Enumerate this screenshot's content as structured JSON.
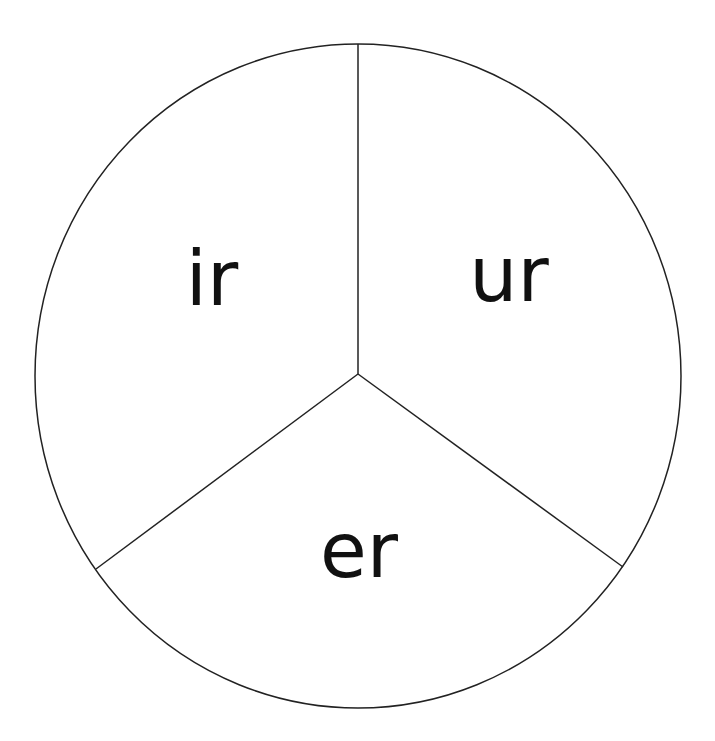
{
  "diagram": {
    "type": "spinner-circle",
    "stroke_color": "#222222",
    "background": "#ffffff",
    "circle": {
      "cx": 358,
      "cy": 376,
      "rx": 323,
      "ry": 332
    },
    "center": {
      "x": 358,
      "y": 374
    },
    "dividers": [
      {
        "x2": 358,
        "y2": 44
      },
      {
        "x2": 96,
        "y2": 569
      },
      {
        "x2": 623,
        "y2": 567
      }
    ],
    "segments": [
      {
        "label": "ir",
        "x": 212,
        "y": 305
      },
      {
        "label": "ur",
        "x": 509,
        "y": 301
      },
      {
        "label": "er",
        "x": 359,
        "y": 577
      }
    ]
  }
}
